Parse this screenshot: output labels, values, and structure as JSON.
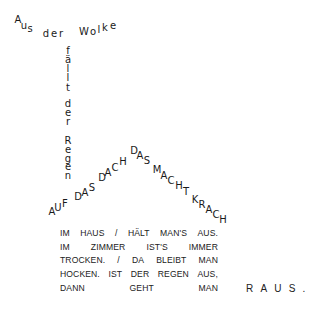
{
  "poem": {
    "cloud_line": {
      "text": "Aus der Wolke",
      "glyphs": [
        {
          "c": "A",
          "x": 18,
          "y": 20
        },
        {
          "c": "u",
          "x": 24,
          "y": 26
        },
        {
          "c": "s",
          "x": 30,
          "y": 29
        },
        {
          "c": "d",
          "x": 46,
          "y": 34
        },
        {
          "c": "e",
          "x": 54,
          "y": 34
        },
        {
          "c": "r",
          "x": 61,
          "y": 34
        },
        {
          "c": "W",
          "x": 84,
          "y": 32
        },
        {
          "c": "o",
          "x": 93,
          "y": 32
        },
        {
          "c": "l",
          "x": 99,
          "y": 30
        },
        {
          "c": "k",
          "x": 105,
          "y": 28
        },
        {
          "c": "e",
          "x": 113,
          "y": 26
        }
      ]
    },
    "rain_column": {
      "text": "fällt der Regen",
      "glyphs": [
        {
          "c": "f",
          "x": 68,
          "y": 51
        },
        {
          "c": "ä",
          "x": 68,
          "y": 60
        },
        {
          "c": "l",
          "x": 68,
          "y": 69
        },
        {
          "c": "l",
          "x": 68,
          "y": 78
        },
        {
          "c": "t",
          "x": 68,
          "y": 88
        },
        {
          "c": "d",
          "x": 68,
          "y": 104
        },
        {
          "c": "e",
          "x": 68,
          "y": 113
        },
        {
          "c": "r",
          "x": 68,
          "y": 122
        },
        {
          "c": "R",
          "x": 68,
          "y": 141
        },
        {
          "c": "e",
          "x": 68,
          "y": 150
        },
        {
          "c": "g",
          "x": 68,
          "y": 159
        },
        {
          "c": "e",
          "x": 68,
          "y": 167
        },
        {
          "c": "n",
          "x": 68,
          "y": 176
        }
      ]
    },
    "roof": {
      "text": "AUF DAS DACH DAS MACHT KRACH",
      "glyphs": [
        {
          "c": "A",
          "x": 52,
          "y": 212
        },
        {
          "c": "U",
          "x": 58,
          "y": 208
        },
        {
          "c": "F",
          "x": 65,
          "y": 204
        },
        {
          "c": "D",
          "x": 78,
          "y": 197
        },
        {
          "c": "A",
          "x": 85,
          "y": 193
        },
        {
          "c": "S",
          "x": 92,
          "y": 188
        },
        {
          "c": "D",
          "x": 102,
          "y": 178
        },
        {
          "c": "A",
          "x": 108,
          "y": 173
        },
        {
          "c": "C",
          "x": 115,
          "y": 168
        },
        {
          "c": "H",
          "x": 123,
          "y": 162
        },
        {
          "c": "D",
          "x": 134,
          "y": 151
        },
        {
          "c": "A",
          "x": 140,
          "y": 156
        },
        {
          "c": "S",
          "x": 147,
          "y": 161
        },
        {
          "c": "M",
          "x": 157,
          "y": 170
        },
        {
          "c": "A",
          "x": 164,
          "y": 176
        },
        {
          "c": "C",
          "x": 171,
          "y": 181
        },
        {
          "c": "H",
          "x": 179,
          "y": 186
        },
        {
          "c": "T",
          "x": 186,
          "y": 192
        },
        {
          "c": "K",
          "x": 195,
          "y": 200
        },
        {
          "c": "R",
          "x": 202,
          "y": 205
        },
        {
          "c": "A",
          "x": 209,
          "y": 210
        },
        {
          "c": "C",
          "x": 216,
          "y": 215
        },
        {
          "c": "H",
          "x": 223,
          "y": 220
        }
      ]
    },
    "house": {
      "lines": [
        [
          "IM",
          "HAUS",
          "/",
          "HÄLT",
          "MAN'S",
          "AUS."
        ],
        [
          "IM",
          "ZIMMER",
          "IST'S",
          "IMMER"
        ],
        [
          "TROCKEN.",
          "/",
          "DA",
          "BLEIBT",
          "MAN"
        ],
        [
          "HOCKEN.",
          "IST",
          "DER",
          "REGEN",
          "AUS,"
        ],
        [
          "DANN",
          "GEHT",
          "MAN"
        ]
      ]
    },
    "ending": "RAUS."
  }
}
